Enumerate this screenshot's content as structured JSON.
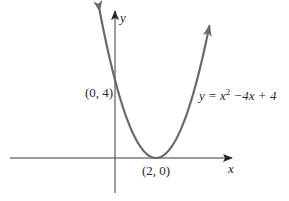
{
  "chart_data": {
    "type": "line",
    "title": "",
    "xlabel": "x",
    "ylabel": "y",
    "function": "y = x^2 - 4x + 4",
    "equation_label": {
      "prefix": "y = x",
      "exponent": "2",
      "suffix": " −4x + 4"
    },
    "series": [
      {
        "name": "y = x^2 - 4x + 4",
        "x": [
          -0.75,
          0,
          0.5,
          1,
          1.5,
          2,
          2.5,
          3,
          3.5,
          4,
          4.6
        ],
        "y": [
          7.56,
          4,
          2.25,
          1,
          0.25,
          0,
          0.25,
          1,
          2.25,
          4,
          6.76
        ]
      }
    ],
    "annotations": [
      {
        "label": "(0, 4)",
        "x": 0,
        "y": 4
      },
      {
        "label": "(2, 0)",
        "x": 2,
        "y": 0
      }
    ],
    "xlim": [
      -5,
      5.6
    ],
    "ylim": [
      -1.8,
      7.4
    ],
    "grid": false,
    "legend": "none",
    "curve_color": "#6a6a6a",
    "axis_color": "#3a3a3a"
  },
  "labels": {
    "y_axis": "y",
    "x_axis": "x",
    "vertex": "(2, 0)",
    "y_intercept": "(0, 4)"
  }
}
